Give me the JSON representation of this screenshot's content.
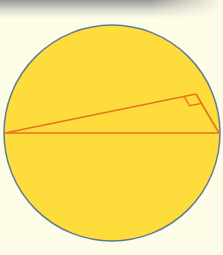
{
  "figure": {
    "colors": {
      "background": "#fdfce6",
      "circle_fill": "#fddc3c",
      "circle_stroke": "#5f7f8f",
      "line": "#e8731e"
    },
    "circle": {
      "cx": 112,
      "cy": 133,
      "r": 108
    },
    "triangle": {
      "A": [
        5,
        133
      ],
      "B": [
        219,
        133
      ],
      "C": [
        196,
        94
      ]
    },
    "right_angle_marker": true
  }
}
